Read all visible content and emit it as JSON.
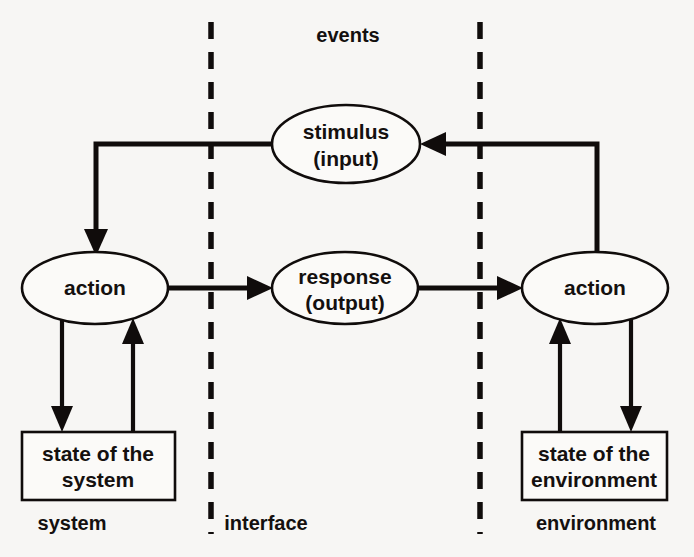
{
  "diagram": {
    "colors": {
      "ink": "#100c0b",
      "paper": "#f7f6f4",
      "shape_fill": "#fbfaf8"
    },
    "zones": {
      "left": "system",
      "middle": "interface",
      "right": "environment"
    },
    "top_label": "events",
    "nodes": {
      "stimulus": {
        "line1": "stimulus",
        "line2": "(input)",
        "shape": "ellipse"
      },
      "response": {
        "line1": "response",
        "line2": "(output)",
        "shape": "ellipse"
      },
      "action_left": {
        "line1": "action",
        "shape": "ellipse"
      },
      "action_right": {
        "line1": "action",
        "shape": "ellipse"
      },
      "state_system": {
        "line1": "state of the",
        "line2": "system",
        "shape": "rectangle"
      },
      "state_environment": {
        "line1": "state of the",
        "line2": "environment",
        "shape": "rectangle"
      }
    },
    "edges": [
      {
        "name": "stimulus-to-action-left",
        "from": "stimulus",
        "to": "action_left",
        "style": "elbow"
      },
      {
        "name": "action-left-to-response",
        "from": "action_left",
        "to": "response",
        "style": "straight"
      },
      {
        "name": "response-to-action-right",
        "from": "response",
        "to": "action_right",
        "style": "straight"
      },
      {
        "name": "action-right-to-stimulus",
        "from": "action_right",
        "to": "stimulus",
        "style": "elbow"
      },
      {
        "name": "action-left-to-state-system",
        "from": "action_left",
        "to": "state_system",
        "style": "straight"
      },
      {
        "name": "state-system-to-action-left",
        "from": "state_system",
        "to": "action_left",
        "style": "straight"
      },
      {
        "name": "state-environment-to-action-right",
        "from": "state_environment",
        "to": "action_right",
        "style": "straight"
      },
      {
        "name": "action-right-to-state-environment",
        "from": "action_right",
        "to": "state_environment",
        "style": "straight"
      }
    ]
  }
}
